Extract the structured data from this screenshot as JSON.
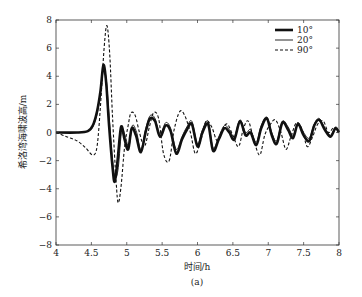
{
  "chart_data": {
    "type": "line",
    "title": "",
    "caption": "(a)",
    "xlabel": "时间/h",
    "ylabel": "希洛湾海啸波高/m",
    "xlim": [
      4,
      8
    ],
    "ylim": [
      -8,
      8
    ],
    "xticks": [
      "4",
      "4.5",
      "5",
      "5.5",
      "6",
      "6.5",
      "7",
      "7.5",
      "8"
    ],
    "yticks": [
      "8",
      "6",
      "4",
      "2",
      "0",
      "-2",
      "-4",
      "-6",
      "-8"
    ],
    "grid": false,
    "legend_position": "upper right",
    "series": [
      {
        "name": "10°",
        "style": "thick-solid",
        "x": [
          4.0,
          4.3,
          4.45,
          4.52,
          4.58,
          4.63,
          4.67,
          4.71,
          4.75,
          4.8,
          4.83,
          4.87,
          4.92,
          4.97,
          5.02,
          5.07,
          5.13,
          5.2,
          5.27,
          5.33,
          5.4,
          5.47,
          5.55,
          5.62,
          5.7,
          5.78,
          5.85,
          5.92,
          6.0,
          6.07,
          6.15,
          6.22,
          6.3,
          6.38,
          6.45,
          6.52,
          6.6,
          6.68,
          6.75,
          6.83,
          6.9,
          6.98,
          7.05,
          7.12,
          7.2,
          7.28,
          7.35,
          7.42,
          7.5,
          7.58,
          7.65,
          7.72,
          7.8,
          7.88,
          7.95,
          8.0
        ],
        "y": [
          0.0,
          0.0,
          0.1,
          0.5,
          1.5,
          3.0,
          4.8,
          3.5,
          0.5,
          -2.5,
          -3.5,
          -2.0,
          0.4,
          -0.5,
          -1.2,
          0.3,
          -0.2,
          -1.4,
          0.1,
          1.0,
          0.8,
          -0.3,
          0.5,
          0.1,
          -1.5,
          -0.5,
          0.2,
          0.6,
          -1.0,
          0.0,
          0.6,
          -1.3,
          -0.5,
          0.3,
          0.0,
          -0.5,
          0.8,
          -0.2,
          0.0,
          -0.9,
          0.3,
          1.0,
          -0.2,
          -0.8,
          0.7,
          0.2,
          -0.4,
          0.6,
          -0.2,
          -0.6,
          0.5,
          0.9,
          0.2,
          -0.3,
          0.3,
          0.0
        ]
      },
      {
        "name": "20°",
        "style": "thin-solid",
        "x": [
          4.0,
          4.3,
          4.45,
          4.52,
          4.58,
          4.63,
          4.67,
          4.71,
          4.75,
          4.8,
          4.84,
          4.88,
          4.93,
          4.98,
          5.03,
          5.08,
          5.14,
          5.2,
          5.27,
          5.33,
          5.4,
          5.47,
          5.55,
          5.62,
          5.7,
          5.78,
          5.85,
          5.92,
          6.0,
          6.07,
          6.15,
          6.22,
          6.3,
          6.38,
          6.45,
          6.52,
          6.6,
          6.68,
          6.75,
          6.83,
          6.9,
          6.98,
          7.05,
          7.12,
          7.2,
          7.28,
          7.35,
          7.42,
          7.5,
          7.58,
          7.65,
          7.72,
          7.8,
          7.88,
          7.95,
          8.0
        ],
        "y": [
          0.0,
          0.0,
          0.1,
          0.4,
          1.3,
          2.8,
          4.4,
          3.8,
          1.2,
          -2.0,
          -3.2,
          -2.5,
          0.2,
          -0.3,
          -1.0,
          0.5,
          0.0,
          -1.2,
          0.3,
          1.2,
          1.0,
          -0.1,
          0.7,
          0.3,
          -1.2,
          -0.3,
          0.4,
          0.8,
          -0.8,
          0.2,
          0.8,
          -1.1,
          -0.3,
          0.5,
          0.2,
          -0.3,
          0.9,
          0.0,
          0.2,
          -0.7,
          0.5,
          1.1,
          0.0,
          -0.6,
          0.8,
          0.4,
          -0.2,
          0.7,
          0.0,
          -0.4,
          0.6,
          1.0,
          0.3,
          -0.2,
          0.4,
          0.1
        ]
      },
      {
        "name": "90°",
        "style": "dashed",
        "x": [
          4.0,
          4.15,
          4.3,
          4.42,
          4.52,
          4.58,
          4.63,
          4.68,
          4.72,
          4.76,
          4.8,
          4.85,
          4.88,
          4.92,
          4.97,
          5.02,
          5.06,
          5.12,
          5.18,
          5.25,
          5.32,
          5.38,
          5.45,
          5.52,
          5.6,
          5.67,
          5.75,
          5.82,
          5.9,
          5.97,
          6.05,
          6.12,
          6.2,
          6.28,
          6.35,
          6.42,
          6.5,
          6.58,
          6.65,
          6.72,
          6.8,
          6.88,
          6.95,
          7.02,
          7.1,
          7.18,
          7.25,
          7.32,
          7.4,
          7.48,
          7.55,
          7.62,
          7.7,
          7.78,
          7.85,
          7.92,
          8.0
        ],
        "y": [
          0.0,
          -0.3,
          -0.6,
          -1.1,
          -1.6,
          -1.0,
          2.0,
          6.0,
          7.6,
          5.5,
          1.0,
          -3.5,
          -5.0,
          -3.8,
          -1.0,
          0.5,
          1.4,
          1.2,
          0.0,
          -1.0,
          0.4,
          1.4,
          1.0,
          -1.5,
          -2.0,
          0.2,
          1.5,
          1.2,
          0.0,
          -1.5,
          -0.5,
          0.8,
          0.4,
          -0.6,
          0.2,
          0.6,
          -0.2,
          -1.0,
          0.3,
          0.8,
          -0.6,
          -1.6,
          -0.2,
          0.5,
          0.9,
          0.0,
          -1.2,
          -0.3,
          0.7,
          0.2,
          -1.0,
          -0.4,
          0.6,
          0.8,
          0.0,
          0.3,
          0.1
        ]
      }
    ]
  },
  "legend": [
    {
      "label": "10°"
    },
    {
      "label": "20°"
    },
    {
      "label": "90°"
    }
  ],
  "axes": {
    "xlabel": "时间/h",
    "ylabel": "希洛湾海啸波高/m",
    "caption": "(a)"
  }
}
